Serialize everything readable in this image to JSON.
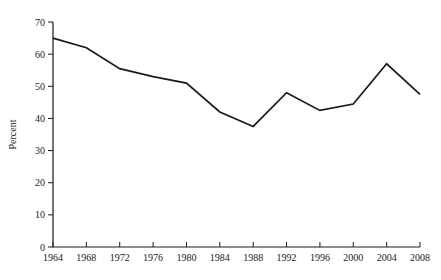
{
  "chart_data": {
    "type": "line",
    "title": "",
    "subtitle": "",
    "xlabel": "",
    "ylabel": "Percent",
    "x": [
      1964,
      1968,
      1972,
      1976,
      1980,
      1984,
      1988,
      1992,
      1996,
      2000,
      2004,
      2008
    ],
    "xtick_labels": [
      "1964",
      "1968",
      "1972",
      "1976",
      "1980",
      "1984",
      "1988",
      "1992",
      "1996",
      "2000",
      "2004",
      "2008"
    ],
    "xlim": [
      1964,
      2008
    ],
    "ylim": [
      0,
      70
    ],
    "ytick_labels": [
      "0",
      "10",
      "20",
      "30",
      "40",
      "50",
      "60",
      "70"
    ],
    "yticks": [
      0,
      10,
      20,
      30,
      40,
      50,
      60,
      70
    ],
    "grid": false,
    "legend": null,
    "series": [
      {
        "name": "Percent",
        "color": "#1a1a1a",
        "values": [
          65,
          62,
          55.5,
          53,
          51,
          42,
          37.5,
          48,
          42.5,
          44.5,
          57,
          47.5
        ]
      }
    ]
  }
}
